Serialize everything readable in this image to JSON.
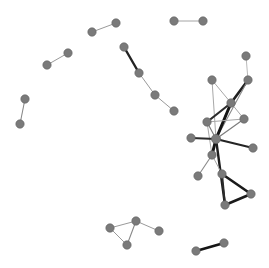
{
  "figure": {
    "title": "",
    "type": "network-graph",
    "width": 269,
    "height": 268,
    "background_color": "#ffffff",
    "node_color": "#7a7a7a",
    "node_stroke_color": "#5f5f5f",
    "node_radius": 4.2,
    "edge_color_dark": "#1c1c1c",
    "edge_color_mid": "#6b6b6b",
    "edge_color_light": "#b0b0b0"
  },
  "chart_data": {
    "type": "network",
    "title": "",
    "xlabel": "",
    "ylabel": "",
    "grid": false,
    "legend": "none",
    "xlim": [
      0,
      269
    ],
    "ylim": [
      0,
      268
    ],
    "node_count": 34,
    "edge_count": 38,
    "component_count": 8,
    "nodes": [
      {
        "id": "n1",
        "x": 174,
        "y": 21,
        "r": 4.2,
        "component": "pair-top-right"
      },
      {
        "id": "n2",
        "x": 203,
        "y": 21,
        "r": 4.2,
        "component": "pair-top-right"
      },
      {
        "id": "n3",
        "x": 92,
        "y": 32,
        "r": 4.2,
        "component": "pair-top-mid"
      },
      {
        "id": "n4",
        "x": 116,
        "y": 23,
        "r": 4.2,
        "component": "pair-top-mid"
      },
      {
        "id": "n5",
        "x": 47,
        "y": 65,
        "r": 4.2,
        "component": "pair-left-upper"
      },
      {
        "id": "n6",
        "x": 68,
        "y": 53,
        "r": 4.2,
        "component": "pair-left-upper"
      },
      {
        "id": "n7",
        "x": 25,
        "y": 99,
        "r": 4.2,
        "component": "pair-left-lower"
      },
      {
        "id": "n8",
        "x": 20,
        "y": 124,
        "r": 4.2,
        "component": "pair-left-lower"
      },
      {
        "id": "n9",
        "x": 124,
        "y": 47,
        "r": 4.2,
        "component": "chain-center"
      },
      {
        "id": "n10",
        "x": 139,
        "y": 73,
        "r": 4.2,
        "component": "chain-center"
      },
      {
        "id": "n11",
        "x": 155,
        "y": 95,
        "r": 4.2,
        "component": "chain-center"
      },
      {
        "id": "n12",
        "x": 174,
        "y": 111,
        "r": 4.2,
        "component": "chain-center"
      },
      {
        "id": "n13",
        "x": 212,
        "y": 80,
        "r": 4.2,
        "component": "hub-cluster"
      },
      {
        "id": "n14",
        "x": 248,
        "y": 80,
        "r": 4.2,
        "component": "hub-cluster"
      },
      {
        "id": "n15",
        "x": 246,
        "y": 56,
        "r": 4.2,
        "component": "hub-cluster"
      },
      {
        "id": "n16",
        "x": 231,
        "y": 103,
        "r": 4.2,
        "component": "hub-cluster"
      },
      {
        "id": "n17",
        "x": 207,
        "y": 122,
        "r": 4.2,
        "component": "hub-cluster"
      },
      {
        "id": "n18",
        "x": 244,
        "y": 119,
        "r": 4.2,
        "component": "hub-cluster"
      },
      {
        "id": "n19",
        "x": 191,
        "y": 138,
        "r": 4.2,
        "component": "hub-cluster"
      },
      {
        "id": "n20",
        "x": 216,
        "y": 139,
        "r": 4.6,
        "component": "hub-cluster"
      },
      {
        "id": "n21",
        "x": 253,
        "y": 148,
        "r": 4.2,
        "component": "hub-cluster"
      },
      {
        "id": "n22",
        "x": 212,
        "y": 155,
        "r": 4.2,
        "component": "hub-cluster"
      },
      {
        "id": "n23",
        "x": 198,
        "y": 176,
        "r": 4.2,
        "component": "hub-cluster"
      },
      {
        "id": "n24",
        "x": 222,
        "y": 174,
        "r": 4.2,
        "component": "triangle-right"
      },
      {
        "id": "n25",
        "x": 251,
        "y": 194,
        "r": 4.2,
        "component": "triangle-right"
      },
      {
        "id": "n26",
        "x": 225,
        "y": 205,
        "r": 4.2,
        "component": "triangle-right"
      },
      {
        "id": "n27",
        "x": 110,
        "y": 228,
        "r": 4.2,
        "component": "triangle-bottom-left"
      },
      {
        "id": "n28",
        "x": 136,
        "y": 221,
        "r": 4.2,
        "component": "triangle-bottom-left"
      },
      {
        "id": "n29",
        "x": 127,
        "y": 245,
        "r": 4.2,
        "component": "triangle-bottom-left"
      },
      {
        "id": "n30",
        "x": 159,
        "y": 231,
        "r": 4.2,
        "component": "triangle-bottom-left"
      },
      {
        "id": "n31",
        "x": 196,
        "y": 251,
        "r": 4.2,
        "component": "pair-bottom-right"
      },
      {
        "id": "n32",
        "x": 224,
        "y": 243,
        "r": 4.2,
        "component": "pair-bottom-right"
      }
    ],
    "edges": [
      {
        "source": "n1",
        "target": "n2",
        "width": 0.9,
        "color": "#9a9a9a"
      },
      {
        "source": "n3",
        "target": "n4",
        "width": 1.0,
        "color": "#9a9a9a"
      },
      {
        "source": "n5",
        "target": "n6",
        "width": 1.0,
        "color": "#9a9a9a"
      },
      {
        "source": "n7",
        "target": "n8",
        "width": 1.1,
        "color": "#8a8a8a"
      },
      {
        "source": "n9",
        "target": "n10",
        "width": 2.4,
        "color": "#232323"
      },
      {
        "source": "n10",
        "target": "n11",
        "width": 1.0,
        "color": "#9a9a9a"
      },
      {
        "source": "n11",
        "target": "n12",
        "width": 1.0,
        "color": "#9a9a9a"
      },
      {
        "source": "n13",
        "target": "n20",
        "width": 1.0,
        "color": "#a8a8a8"
      },
      {
        "source": "n13",
        "target": "n16",
        "width": 1.0,
        "color": "#a8a8a8"
      },
      {
        "source": "n14",
        "target": "n15",
        "width": 0.9,
        "color": "#b2b2b2"
      },
      {
        "source": "n14",
        "target": "n16",
        "width": 2.6,
        "color": "#202020"
      },
      {
        "source": "n14",
        "target": "n20",
        "width": 1.1,
        "color": "#8a8a8a"
      },
      {
        "source": "n16",
        "target": "n17",
        "width": 2.2,
        "color": "#2b2b2b"
      },
      {
        "source": "n16",
        "target": "n20",
        "width": 3.0,
        "color": "#141414"
      },
      {
        "source": "n16",
        "target": "n18",
        "width": 1.0,
        "color": "#a8a8a8"
      },
      {
        "source": "n17",
        "target": "n18",
        "width": 1.0,
        "color": "#a8a8a8"
      },
      {
        "source": "n17",
        "target": "n20",
        "width": 1.2,
        "color": "#7d7d7d"
      },
      {
        "source": "n17",
        "target": "n22",
        "width": 1.0,
        "color": "#a8a8a8"
      },
      {
        "source": "n18",
        "target": "n20",
        "width": 1.2,
        "color": "#7d7d7d"
      },
      {
        "source": "n19",
        "target": "n20",
        "width": 2.0,
        "color": "#2b2b2b"
      },
      {
        "source": "n20",
        "target": "n21",
        "width": 2.2,
        "color": "#242424"
      },
      {
        "source": "n20",
        "target": "n22",
        "width": 3.0,
        "color": "#141414"
      },
      {
        "source": "n20",
        "target": "n26",
        "width": 2.4,
        "color": "#1e1e1e"
      },
      {
        "source": "n22",
        "target": "n23",
        "width": 1.1,
        "color": "#8a8a8a"
      },
      {
        "source": "n22",
        "target": "n24",
        "width": 1.0,
        "color": "#a8a8a8"
      },
      {
        "source": "n24",
        "target": "n25",
        "width": 2.6,
        "color": "#1a1a1a"
      },
      {
        "source": "n24",
        "target": "n26",
        "width": 2.0,
        "color": "#2b2b2b"
      },
      {
        "source": "n25",
        "target": "n26",
        "width": 2.6,
        "color": "#1a1a1a"
      },
      {
        "source": "n27",
        "target": "n28",
        "width": 1.0,
        "color": "#9a9a9a"
      },
      {
        "source": "n27",
        "target": "n29",
        "width": 1.0,
        "color": "#9a9a9a"
      },
      {
        "source": "n28",
        "target": "n29",
        "width": 1.1,
        "color": "#8a8a8a"
      },
      {
        "source": "n28",
        "target": "n30",
        "width": 1.0,
        "color": "#9a9a9a"
      },
      {
        "source": "n31",
        "target": "n32",
        "width": 2.8,
        "color": "#151515"
      }
    ]
  }
}
